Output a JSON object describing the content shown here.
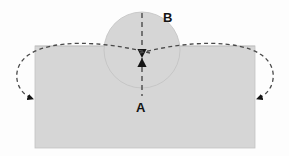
{
  "canvas": {
    "width": 289,
    "height": 156,
    "background_color": "#fdfdfd"
  },
  "colors": {
    "shape_fill": "#d6d6d6",
    "shape_stroke": "#c2c2c2",
    "dashed_line": "#4a4a4a",
    "arrow_fill": "#141414",
    "label_color": "#141414"
  },
  "shapes": {
    "plate": {
      "name": "rectangular-plate",
      "x": 35,
      "y": 46,
      "width": 220,
      "height": 102,
      "fill": "#d6d6d6"
    },
    "circle": {
      "name": "circular-boss",
      "cx": 142,
      "cy": 50,
      "r": 38,
      "fill": "#d6d6d6"
    }
  },
  "centerline": {
    "name": "vertical-centerline",
    "x": 142,
    "y_top": 13,
    "y_bottom": 96,
    "dash": "5,4"
  },
  "dimension_arrows": {
    "name": "opposed-arrowheads",
    "x": 142,
    "meet_y": 58,
    "upper_arrow_points_down": true,
    "lower_arrow_points_up": true
  },
  "curved_arrows": [
    {
      "name": "left-loop-arrow",
      "side": "left",
      "path": "M 150 53 C 100 40, 52 40, 30 54 C 10 66, 14 92, 33 99",
      "arrow_tip_x": 37,
      "arrow_tip_y": 99,
      "direction": "right-down"
    },
    {
      "name": "right-loop-arrow",
      "side": "right",
      "path": "M 140 53 C 190 40, 238 40, 260 54 C 280 66, 276 92, 257 99",
      "arrow_tip_x": 253,
      "arrow_tip_y": 99,
      "direction": "left-down"
    }
  ],
  "labels": [
    {
      "name": "label-b",
      "text": "B",
      "x": 163,
      "y": 22,
      "describes": "circular-boss"
    },
    {
      "name": "label-a",
      "text": "A",
      "x": 136,
      "y": 112,
      "describes": "rectangular-plate"
    }
  ]
}
